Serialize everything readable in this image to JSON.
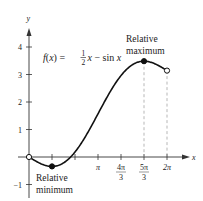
{
  "chart_data": {
    "type": "line",
    "title": "",
    "function_label": {
      "lhs": "f(x) = ",
      "frac_num": "1",
      "frac_den": "2",
      "rhs": "x − sin x"
    },
    "xlabel": "x",
    "ylabel": "y",
    "x_ticks": [
      {
        "value": 1.0472,
        "label": ""
      },
      {
        "value": 2.0944,
        "label": ""
      },
      {
        "value": 3.1416,
        "label": "π"
      },
      {
        "value": 4.1888,
        "num": "4π",
        "den": "3"
      },
      {
        "value": 5.236,
        "num": "5π",
        "den": "3"
      },
      {
        "value": 6.2832,
        "label": "2π"
      }
    ],
    "y_ticks": [
      {
        "value": -1,
        "label": "−1"
      },
      {
        "value": 1,
        "label": "1"
      },
      {
        "value": 2,
        "label": "2"
      },
      {
        "value": 3,
        "label": "3"
      },
      {
        "value": 4,
        "label": "4"
      }
    ],
    "xlim": [
      0,
      6.2832
    ],
    "ylim": [
      -1,
      4.5
    ],
    "grid": false,
    "series": [
      {
        "name": "f(x) = 1/2 x − sin x",
        "domain": [
          0,
          6.2832
        ],
        "x": [
          0,
          0.5236,
          1.0472,
          1.5708,
          2.0944,
          2.618,
          3.1416,
          3.6652,
          4.1888,
          4.7124,
          5.236,
          5.7596,
          6.2832
        ],
        "y": [
          0,
          -0.238,
          -0.342,
          -0.215,
          0.181,
          0.809,
          1.571,
          2.333,
          2.96,
          3.356,
          3.484,
          3.38,
          3.142
        ]
      }
    ],
    "points": [
      {
        "x": 0,
        "y": 0,
        "style": "open"
      },
      {
        "x": 1.0472,
        "y": -0.342,
        "style": "filled",
        "label": "relative_min"
      },
      {
        "x": 5.236,
        "y": 3.484,
        "style": "filled",
        "label": "relative_max"
      },
      {
        "x": 6.2832,
        "y": 3.1416,
        "style": "open"
      }
    ],
    "annotations": {
      "relative_max": {
        "line1": "Relative",
        "line2": "maximum"
      },
      "relative_min": {
        "line1": "Relative",
        "line2": "minimum"
      }
    },
    "dashed_guides": [
      5.236,
      6.2832
    ]
  }
}
